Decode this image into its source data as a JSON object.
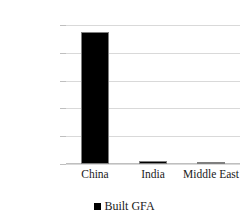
{
  "chart_data": {
    "type": "bar",
    "title": "",
    "subtitle": "",
    "xlabel": "",
    "ylabel": "",
    "categories": [
      "China",
      "India",
      "Middle East"
    ],
    "series": [
      {
        "name": "Built GFA",
        "values": [
          237000,
          5000,
          2500
        ],
        "color": "#000000"
      }
    ],
    "ylim": [
      0,
      250000
    ],
    "yticks": [
      0,
      50000,
      100000,
      150000,
      200000,
      250000
    ],
    "ytick_labels": [
      "0",
      "50000",
      "100000",
      "150000",
      "200000",
      "250000"
    ],
    "grid": true,
    "grid_color": "#d9d9d9",
    "legend": {
      "position": "bottom",
      "entries": [
        {
          "label": "Built GFA",
          "marker": "square-marker",
          "color": "#000000"
        }
      ]
    }
  }
}
